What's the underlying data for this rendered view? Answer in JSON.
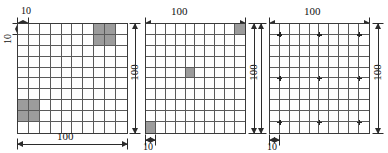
{
  "figure": {
    "grid_cols": 10,
    "grid_rows": 10,
    "cell_size_label": "10",
    "side_length_label": "100",
    "shade_color": "#9c9c9c",
    "line_color": "#5a5a5a",
    "border_color": "#3a3a3a",
    "marker_color": "#222222"
  },
  "panels": [
    {
      "id": "panel-1",
      "name": "grid-block-pattern",
      "dimensions": {
        "top_cell": "10",
        "left_cell": "10",
        "bottom_side": "100"
      },
      "shaded_cells": [
        {
          "row": 0,
          "col": 7
        },
        {
          "row": 0,
          "col": 8
        },
        {
          "row": 1,
          "col": 7
        },
        {
          "row": 1,
          "col": 8
        },
        {
          "row": 7,
          "col": 0
        },
        {
          "row": 7,
          "col": 1
        },
        {
          "row": 8,
          "col": 0
        },
        {
          "row": 8,
          "col": 1
        }
      ],
      "markers": []
    },
    {
      "id": "panel-2",
      "name": "grid-single-cell-pattern",
      "dimensions": {
        "top_side": "100",
        "left_side": "100",
        "right_side": "100",
        "bottom_cell": "10"
      },
      "shaded_cells": [
        {
          "row": 0,
          "col": 9
        },
        {
          "row": 4,
          "col": 4
        },
        {
          "row": 9,
          "col": 0
        }
      ],
      "markers": []
    },
    {
      "id": "panel-3",
      "name": "grid-marker-pattern",
      "dimensions": {
        "top_side": "100",
        "left_side": "100",
        "right_side": "100",
        "bottom_cell": "10"
      },
      "shaded_cells": [],
      "markers": [
        {
          "row": 1,
          "col": 1
        },
        {
          "row": 1,
          "col": 5
        },
        {
          "row": 1,
          "col": 9
        },
        {
          "row": 5,
          "col": 1
        },
        {
          "row": 5,
          "col": 5
        },
        {
          "row": 5,
          "col": 9
        },
        {
          "row": 9,
          "col": 1
        },
        {
          "row": 9,
          "col": 5
        },
        {
          "row": 9,
          "col": 9
        }
      ]
    }
  ]
}
